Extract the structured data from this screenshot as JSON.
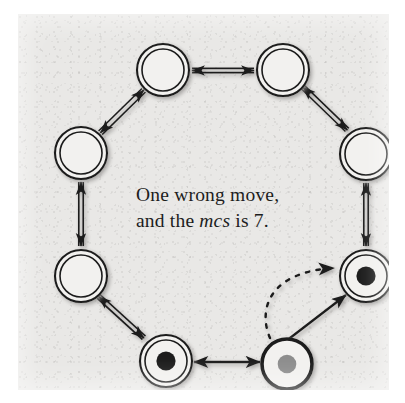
{
  "figure": {
    "kind": "petri-net-token-ring-diagram",
    "page_background": "#e9e8e6",
    "ink_color": "#1d1d1d",
    "token_black": "#1f1f1f",
    "token_gray": "#8d8d8d",
    "caption": {
      "line1": "One wrong move,",
      "line2_pre": "and the ",
      "line2_em": "mcs",
      "line2_post": " is 7."
    },
    "nodes": [
      {
        "id": "n-top-left",
        "style": "double-ring",
        "token": "none",
        "cx": 145,
        "cy": 56,
        "r": 26,
        "label": "empty-place-top-left"
      },
      {
        "id": "n-top-right",
        "style": "double-ring",
        "token": "none",
        "cx": 265,
        "cy": 56,
        "r": 26,
        "label": "empty-place-top-right"
      },
      {
        "id": "n-left-upper",
        "style": "double-ring",
        "token": "none",
        "cx": 63,
        "cy": 139,
        "r": 26,
        "label": "empty-place-left-upper"
      },
      {
        "id": "n-right-upper",
        "style": "double-ring",
        "token": "none",
        "cx": 348,
        "cy": 140,
        "r": 26,
        "label": "empty-place-right-upper"
      },
      {
        "id": "n-left-lower",
        "style": "double-ring",
        "token": "none",
        "cx": 63,
        "cy": 262,
        "r": 26,
        "label": "empty-place-left-lower"
      },
      {
        "id": "n-right-lower",
        "style": "double-ring",
        "token": "black",
        "cx": 348,
        "cy": 262,
        "r": 26,
        "label": "token-place-right-lower"
      },
      {
        "id": "n-bottom-left",
        "style": "double-ring",
        "token": "black",
        "cx": 148,
        "cy": 347,
        "r": 26,
        "label": "token-place-bottom-left"
      },
      {
        "id": "n-bottom-right",
        "style": "single-ring",
        "token": "gray",
        "cx": 269,
        "cy": 350,
        "r": 25,
        "label": "gray-token-place-bottom-right"
      }
    ],
    "edges": [
      {
        "id": "e-top",
        "from": "n-top-left",
        "to": "n-top-right",
        "style": "double-line",
        "heads": "both"
      },
      {
        "id": "e-left-top",
        "from": "n-left-upper",
        "to": "n-top-left",
        "style": "double-line",
        "heads": "both"
      },
      {
        "id": "e-left-mid",
        "from": "n-left-upper",
        "to": "n-left-lower",
        "style": "double-line",
        "heads": "both"
      },
      {
        "id": "e-left-bottom",
        "from": "n-left-lower",
        "to": "n-bottom-left",
        "style": "double-line",
        "heads": "both"
      },
      {
        "id": "e-right-top",
        "from": "n-top-right",
        "to": "n-right-upper",
        "style": "double-line",
        "heads": "both"
      },
      {
        "id": "e-right-mid",
        "from": "n-right-upper",
        "to": "n-right-lower",
        "style": "double-line",
        "heads": "both"
      },
      {
        "id": "e-bottom",
        "from": "n-bottom-left",
        "to": "n-bottom-right",
        "style": "solid-thin",
        "heads": "both"
      },
      {
        "id": "e-move-solid",
        "from": "n-bottom-right",
        "to": "n-right-lower",
        "style": "solid-thin",
        "heads": "end"
      },
      {
        "id": "e-move-dashed",
        "from": "n-bottom-right",
        "to": "n-right-lower",
        "style": "dashed-curve",
        "heads": "end"
      }
    ]
  }
}
